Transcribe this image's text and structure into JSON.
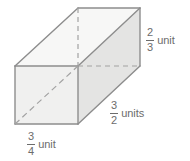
{
  "figure": {
    "type": "rectangular-prism",
    "shape_name": "rectangular prism",
    "background_color": "#ffffff",
    "edge_color": "#8d8d8d",
    "hidden_edge_color": "#9e9e9e",
    "face_colors": {
      "front": "#f0f0ef",
      "top": "#f7f7f6",
      "side": "#e6e6e5"
    },
    "label_color": "#6c6c6c"
  },
  "labels": {
    "height": {
      "numerator": "2",
      "denominator": "3",
      "unit": "unit",
      "full_text": "2/3 unit",
      "edge": "vertical-right"
    },
    "depth": {
      "numerator": "3",
      "denominator": "2",
      "unit": "units",
      "full_text": "3/2 units",
      "edge": "depth-lower-right"
    },
    "width": {
      "numerator": "3",
      "denominator": "4",
      "unit": "unit",
      "full_text": "3/4 unit",
      "edge": "bottom-front"
    }
  }
}
